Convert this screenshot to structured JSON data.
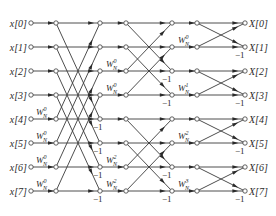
{
  "diagram": {
    "type": "fft-butterfly-signal-flow-graph",
    "inputs": [
      "x[0]",
      "x[1]",
      "x[2]",
      "x[3]",
      "x[4]",
      "x[5]",
      "x[6]",
      "x[7]"
    ],
    "outputs": [
      "X[0]",
      "X[1]",
      "X[2]",
      "X[3]",
      "X[4]",
      "X[5]",
      "X[6]",
      "X[7]"
    ],
    "twiddle_base": "W",
    "twiddle_sub": "N",
    "negation_label": "−1",
    "stage1_twiddles": [
      {
        "row": 4,
        "exp": "0"
      },
      {
        "row": 5,
        "exp": "0"
      },
      {
        "row": 6,
        "exp": "0"
      },
      {
        "row": 7,
        "exp": "0"
      }
    ],
    "stage2_twiddles": [
      {
        "row": 2,
        "exp": "0"
      },
      {
        "row": 3,
        "exp": "0"
      },
      {
        "row": 6,
        "exp": "2"
      },
      {
        "row": 7,
        "exp": "2"
      }
    ],
    "stage3_twiddles": [
      {
        "row": 1,
        "exp": "0"
      },
      {
        "row": 3,
        "exp": "1"
      },
      {
        "row": 5,
        "exp": "2"
      },
      {
        "row": 7,
        "exp": "3"
      }
    ],
    "stage1_negations": [
      4,
      5,
      6,
      7
    ],
    "stage2_negations": [
      2,
      3,
      6,
      7
    ],
    "stage3_negations": [
      1,
      3,
      5,
      7
    ]
  }
}
